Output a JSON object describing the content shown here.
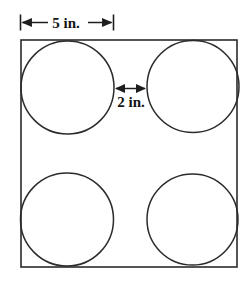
{
  "figure": {
    "background_color": "#ffffff",
    "stroke_color": "#2b2b2b",
    "text_color": "#141414",
    "square": {
      "label": "outer-square",
      "x": 21,
      "y": 40,
      "width": 216,
      "height": 227,
      "stroke_width": 1.6
    },
    "circles": [
      {
        "label": "circle-top-left",
        "cx": 67.5,
        "cy": 87.5,
        "r": 46.5
      },
      {
        "label": "circle-top-right",
        "cx": 193.0,
        "cy": 86.5,
        "r": 46.0
      },
      {
        "label": "circle-bottom-left",
        "cx": 67.0,
        "cy": 219.5,
        "r": 46.5
      },
      {
        "label": "circle-bottom-right",
        "cx": 192.5,
        "cy": 219.5,
        "r": 45.5
      }
    ],
    "dimensions": [
      {
        "label": "width-dimension",
        "text": "5 in.",
        "orientation": "horizontal",
        "x1": 20,
        "x2": 113,
        "y": 22,
        "text_x": 66,
        "text_y": 27,
        "has_end_ticks": true
      },
      {
        "label": "gap-dimension",
        "text": "2 in.",
        "orientation": "horizontal",
        "x1": 114,
        "x2": 147,
        "y": 88,
        "text_x": 131,
        "text_y": 107,
        "has_end_ticks": false
      }
    ]
  }
}
